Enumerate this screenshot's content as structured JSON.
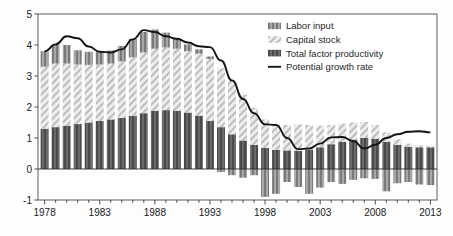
{
  "chart_data": {
    "type": "bar",
    "title": "",
    "subtitle": "",
    "xlabel": "",
    "ylabel": "",
    "xlim": [
      1977.4,
      2013.6
    ],
    "ylim": [
      -1,
      5
    ],
    "yticks": [
      -1,
      0,
      1,
      2,
      3,
      4,
      5
    ],
    "ytick_labels": [
      "-1",
      "0",
      "1",
      "2",
      "3",
      "4",
      "5"
    ],
    "xticks": [
      1978,
      1983,
      1988,
      1993,
      1998,
      2003,
      2008,
      2013
    ],
    "xtick_labels": [
      "1978",
      "1983",
      "1988",
      "1993",
      "1998",
      "2003",
      "2008",
      "2013"
    ],
    "xtick_minor_step": 1,
    "grid": false,
    "stacked": true,
    "legend_position": "top-right",
    "categories": [
      1978,
      1979,
      1980,
      1981,
      1982,
      1983,
      1984,
      1985,
      1986,
      1987,
      1988,
      1989,
      1990,
      1991,
      1992,
      1993,
      1994,
      1995,
      1996,
      1997,
      1998,
      1999,
      2000,
      2001,
      2002,
      2003,
      2004,
      2005,
      2006,
      2007,
      2008,
      2009,
      2010,
      2011,
      2012,
      2013
    ],
    "series": [
      {
        "name": "Total factor productivity",
        "color": "#575757",
        "pattern": "vertical-stripes-dark",
        "values": [
          1.3,
          1.35,
          1.4,
          1.45,
          1.5,
          1.55,
          1.6,
          1.65,
          1.72,
          1.8,
          1.88,
          1.9,
          1.88,
          1.82,
          1.72,
          1.55,
          1.35,
          1.12,
          0.92,
          0.78,
          0.68,
          0.62,
          0.6,
          0.58,
          0.62,
          0.7,
          0.8,
          0.88,
          0.95,
          1.0,
          0.98,
          0.88,
          0.78,
          0.72,
          0.7,
          0.7
        ]
      },
      {
        "name": "Capital stock",
        "color": "#d9d9d9",
        "pattern": "diagonal-hatch-light",
        "values": [
          2.0,
          2.05,
          2.0,
          1.92,
          1.86,
          1.82,
          1.8,
          1.82,
          1.88,
          1.96,
          2.0,
          2.02,
          2.0,
          1.98,
          2.0,
          2.0,
          1.9,
          1.72,
          1.48,
          1.2,
          0.92,
          0.8,
          0.82,
          0.86,
          0.8,
          0.7,
          0.62,
          0.58,
          0.55,
          0.52,
          0.44,
          0.3,
          0.18,
          0.1,
          0.06,
          0.04
        ]
      },
      {
        "name": "Labor input",
        "color": "#8c8c8c",
        "pattern": "vertical-stripes-medium",
        "values": [
          0.5,
          0.62,
          0.6,
          0.46,
          0.42,
          0.4,
          0.42,
          0.5,
          0.6,
          0.66,
          0.62,
          0.48,
          0.34,
          0.22,
          0.14,
          0.08,
          -0.1,
          -0.2,
          -0.28,
          -0.2,
          -0.9,
          -0.8,
          -0.42,
          -0.58,
          -0.8,
          -0.6,
          -0.42,
          -0.48,
          -0.35,
          -0.3,
          -0.32,
          -0.72,
          -0.46,
          -0.42,
          -0.5,
          -0.52
        ]
      }
    ],
    "line_series": {
      "name": "Potential growth rate",
      "color": "#141414",
      "values": [
        3.8,
        4.02,
        4.28,
        4.22,
        3.95,
        3.78,
        3.76,
        3.86,
        4.18,
        4.48,
        4.42,
        4.28,
        4.2,
        4.08,
        3.96,
        3.93,
        3.5,
        2.86,
        2.26,
        1.8,
        1.44,
        1.42,
        1.0,
        0.64,
        0.66,
        0.82,
        1.02,
        1.03,
        0.9,
        0.66,
        0.78,
        1.0,
        1.12,
        1.2,
        1.22,
        1.18
      ],
      "values_note": "smoothed curve of total potential growth"
    },
    "legend_entries": [
      {
        "label": "Labor input",
        "swatch": "vertical-stripes-medium"
      },
      {
        "label": "Capital stock",
        "swatch": "diagonal-hatch-light"
      },
      {
        "label": "Total factor productivity",
        "swatch": "vertical-stripes-dark"
      },
      {
        "label": "Potential growth rate",
        "swatch": "line"
      }
    ]
  },
  "axes": {
    "zero_line_value": "0"
  }
}
